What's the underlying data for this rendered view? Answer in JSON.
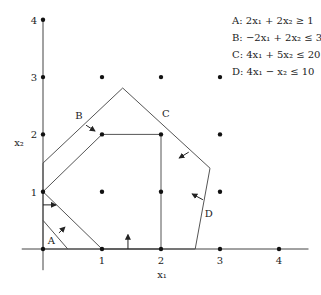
{
  "chart_data": {
    "type": "diagram",
    "title": "",
    "xlabel": "x₁",
    "ylabel": "x₂",
    "xlim": [
      0,
      4
    ],
    "ylim": [
      0,
      4
    ],
    "x_ticks": [
      1,
      2,
      3,
      4
    ],
    "y_ticks": [
      1,
      2,
      3,
      4
    ],
    "x_tick_labels": [
      "1",
      "2",
      "3",
      "4"
    ],
    "y_tick_labels": [
      "1",
      "2",
      "3",
      "4"
    ],
    "legend_placement": "top-right",
    "constraints": [
      {
        "id": "A",
        "text": "A: 2x₁ + 2x₂ ≥ 1"
      },
      {
        "id": "B",
        "text": "B: −2x₁ + 2x₂ ≤ 3"
      },
      {
        "id": "C",
        "text": "C: 4x₁ + 5x₂ ≤ 20"
      },
      {
        "id": "D",
        "text": "D: 4x₁ − x₂ ≤ 10"
      }
    ],
    "feasible_region_lp": {
      "description": "LP relaxation region",
      "color": "#f2f2f2",
      "vertices": [
        [
          0,
          0
        ],
        [
          0,
          1.5
        ],
        [
          1.35,
          2.81
        ],
        [
          2.83,
          1.41
        ],
        [
          2.58,
          0
        ]
      ]
    },
    "integer_hull": {
      "description": "Convex hull of integer points",
      "color": "#cfcfcf",
      "vertices": [
        [
          0,
          1
        ],
        [
          1,
          2
        ],
        [
          2,
          2
        ],
        [
          2,
          0
        ],
        [
          1,
          0
        ]
      ]
    },
    "constraint_A_line": [
      [
        0,
        0.5
      ],
      [
        0.42,
        0
      ]
    ],
    "lattice_points": [
      [
        0,
        0
      ],
      [
        0,
        1
      ],
      [
        0,
        2
      ],
      [
        0,
        3
      ],
      [
        0,
        4
      ],
      [
        1,
        0
      ],
      [
        1,
        1
      ],
      [
        1,
        2
      ],
      [
        1,
        3
      ],
      [
        2,
        0
      ],
      [
        2,
        1
      ],
      [
        2,
        2
      ],
      [
        2,
        3
      ],
      [
        3,
        0
      ],
      [
        3,
        1
      ],
      [
        3,
        2
      ],
      [
        3,
        3
      ],
      [
        4,
        0
      ]
    ],
    "constraint_labels": [
      {
        "id": "A",
        "text": "A",
        "at": [
          0.14,
          0.16
        ]
      },
      {
        "id": "B",
        "text": "B",
        "at": [
          0.61,
          2.34
        ]
      },
      {
        "id": "C",
        "text": "C",
        "at": [
          2.08,
          2.37
        ]
      },
      {
        "id": "D",
        "text": "D",
        "at": [
          2.81,
          0.63
        ]
      }
    ],
    "direction_arrows": [
      {
        "id": "A",
        "from": [
          0.27,
          0.28
        ],
        "to": [
          0.37,
          0.38
        ]
      },
      {
        "id": "B",
        "from": [
          0.73,
          2.16
        ],
        "to": [
          0.88,
          2.06
        ]
      },
      {
        "id": "C",
        "from": [
          2.47,
          1.69
        ],
        "to": [
          2.31,
          1.59
        ]
      },
      {
        "id": "D",
        "from": [
          2.71,
          0.86
        ],
        "to": [
          2.53,
          0.96
        ]
      },
      {
        "id": "x1-nonneg",
        "from": [
          0,
          0.77
        ],
        "to": [
          0.22,
          0.77
        ]
      },
      {
        "id": "x2-nonneg",
        "from": [
          1.44,
          0
        ],
        "to": [
          1.44,
          0.25
        ]
      }
    ],
    "line_color": "#555555"
  }
}
